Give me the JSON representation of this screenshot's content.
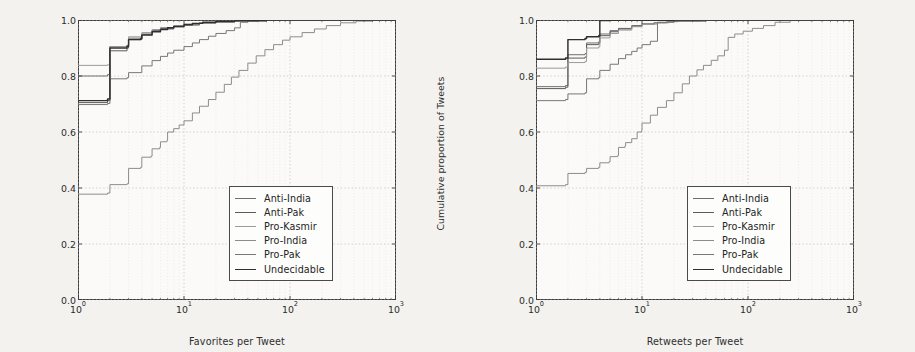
{
  "figure": {
    "background": "#f3f2ef",
    "panel_background": "#fbfaf8",
    "axis_color": "#3a3a3a",
    "grid_color": "#c9c9c9"
  },
  "ylabel": "Cumulative proportion of Tweets",
  "y_ticks": [
    "0.0",
    "0.2",
    "0.4",
    "0.6",
    "0.8",
    "1.0"
  ],
  "x_tick_bases": [
    "10",
    "10",
    "10",
    "10"
  ],
  "x_tick_exps": [
    "0",
    "1",
    "2",
    "3"
  ],
  "legend": {
    "entries": [
      {
        "label": "Anti-India",
        "color": "#6f6f6f"
      },
      {
        "label": "Anti-Pak",
        "color": "#5a5a5a"
      },
      {
        "label": "Pro-Kasmir",
        "color": "#9a9a9a"
      },
      {
        "label": "Pro-India",
        "color": "#8c8c8c"
      },
      {
        "label": "Pro-Pak",
        "color": "#777777"
      },
      {
        "label": "Undecidable",
        "color": "#2f2f2f"
      }
    ]
  },
  "chart_data": [
    {
      "type": "line",
      "panel": "left",
      "title": "",
      "xlabel": "Favorites per Tweet",
      "ylabel": "Cumulative proportion of Tweets",
      "xscale": "log",
      "xlim": [
        1,
        1000
      ],
      "ylim": [
        0.0,
        1.0
      ],
      "grid": true,
      "legend_position": "lower-right",
      "series": [
        {
          "name": "Anti-India",
          "color": "#6f6f6f",
          "points": [
            [
              1,
              0.8
            ],
            [
              1.9,
              0.805
            ],
            [
              2,
              0.905
            ],
            [
              2.9,
              0.908
            ],
            [
              3,
              0.935
            ],
            [
              4,
              0.95
            ],
            [
              5,
              0.962
            ],
            [
              6,
              0.97
            ],
            [
              8,
              0.978
            ],
            [
              10,
              0.984
            ],
            [
              14,
              0.99
            ],
            [
              20,
              0.994
            ],
            [
              30,
              0.997
            ],
            [
              50,
              0.999
            ],
            [
              100,
              1.0
            ],
            [
              1000,
              1.0
            ]
          ]
        },
        {
          "name": "Anti-Pak",
          "color": "#5a5a5a",
          "points": [
            [
              1,
              0.705
            ],
            [
              1.9,
              0.712
            ],
            [
              2,
              0.89
            ],
            [
              2.9,
              0.9
            ],
            [
              3,
              0.93
            ],
            [
              4,
              0.948
            ],
            [
              5,
              0.96
            ],
            [
              6,
              0.968
            ],
            [
              8,
              0.976
            ],
            [
              10,
              0.982
            ],
            [
              14,
              0.989
            ],
            [
              20,
              0.993
            ],
            [
              30,
              0.996
            ],
            [
              50,
              0.999
            ],
            [
              120,
              1.0
            ],
            [
              1000,
              1.0
            ]
          ]
        },
        {
          "name": "Pro-Kasmir",
          "color": "#9a9a9a",
          "points": [
            [
              1,
              0.838
            ],
            [
              1.9,
              0.84
            ],
            [
              2,
              0.905
            ],
            [
              2.9,
              0.91
            ],
            [
              3,
              0.94
            ],
            [
              4,
              0.955
            ],
            [
              5,
              0.966
            ],
            [
              6,
              0.973
            ],
            [
              8,
              0.98
            ],
            [
              10,
              0.986
            ],
            [
              14,
              0.991
            ],
            [
              20,
              0.995
            ],
            [
              30,
              0.998
            ],
            [
              60,
              1.0
            ],
            [
              1000,
              1.0
            ]
          ]
        },
        {
          "name": "Pro-India",
          "color": "#8c8c8c",
          "points": [
            [
              1,
              0.378
            ],
            [
              1.9,
              0.382
            ],
            [
              2,
              0.412
            ],
            [
              2.9,
              0.415
            ],
            [
              3,
              0.47
            ],
            [
              3.9,
              0.474
            ],
            [
              4,
              0.51
            ],
            [
              4.9,
              0.514
            ],
            [
              5,
              0.54
            ],
            [
              5.9,
              0.545
            ],
            [
              6,
              0.565
            ],
            [
              6.9,
              0.57
            ],
            [
              7,
              0.6
            ],
            [
              8,
              0.612
            ],
            [
              9,
              0.625
            ],
            [
              10,
              0.64
            ],
            [
              12,
              0.668
            ],
            [
              14,
              0.692
            ],
            [
              17,
              0.716
            ],
            [
              20,
              0.742
            ],
            [
              24,
              0.77
            ],
            [
              28,
              0.796
            ],
            [
              33,
              0.82
            ],
            [
              40,
              0.846
            ],
            [
              48,
              0.872
            ],
            [
              58,
              0.894
            ],
            [
              70,
              0.912
            ],
            [
              85,
              0.928
            ],
            [
              100,
              0.94
            ],
            [
              130,
              0.955
            ],
            [
              170,
              0.968
            ],
            [
              220,
              0.98
            ],
            [
              300,
              0.99
            ],
            [
              420,
              0.996
            ],
            [
              600,
              0.999
            ],
            [
              1000,
              1.0
            ]
          ]
        },
        {
          "name": "Pro-Pak",
          "color": "#777777",
          "points": [
            [
              1,
              0.698
            ],
            [
              1.9,
              0.702
            ],
            [
              2,
              0.79
            ],
            [
              2.9,
              0.794
            ],
            [
              3,
              0.812
            ],
            [
              4,
              0.836
            ],
            [
              5,
              0.855
            ],
            [
              6,
              0.87
            ],
            [
              7,
              0.882
            ],
            [
              8,
              0.892
            ],
            [
              10,
              0.905
            ],
            [
              12,
              0.918
            ],
            [
              14,
              0.93
            ],
            [
              17,
              0.942
            ],
            [
              20,
              0.952
            ],
            [
              25,
              0.962
            ],
            [
              30,
              0.972
            ],
            [
              34,
              0.992
            ],
            [
              40,
              0.996
            ],
            [
              60,
              0.999
            ],
            [
              120,
              1.0
            ],
            [
              1000,
              1.0
            ]
          ]
        },
        {
          "name": "Undecidable",
          "color": "#2f2f2f",
          "points": [
            [
              1,
              0.712
            ],
            [
              1.9,
              0.718
            ],
            [
              2,
              0.9
            ],
            [
              2.9,
              0.906
            ],
            [
              3,
              0.93
            ],
            [
              3.9,
              0.934
            ],
            [
              4,
              0.946
            ],
            [
              5,
              0.958
            ],
            [
              6,
              0.966
            ],
            [
              7,
              0.972
            ],
            [
              8,
              0.977
            ],
            [
              10,
              0.983
            ],
            [
              12,
              0.988
            ],
            [
              15,
              0.992
            ],
            [
              20,
              0.995
            ],
            [
              30,
              0.998
            ],
            [
              60,
              1.0
            ],
            [
              1000,
              1.0
            ]
          ]
        }
      ]
    },
    {
      "type": "line",
      "panel": "right",
      "title": "",
      "xlabel": "Retweets per Tweet",
      "ylabel": "Cumulative proportion of Tweets",
      "xscale": "log",
      "xlim": [
        1,
        1000
      ],
      "ylim": [
        0.0,
        1.0
      ],
      "grid": true,
      "legend_position": "lower-right",
      "series": [
        {
          "name": "Anti-India",
          "color": "#6f6f6f",
          "points": [
            [
              1,
              0.762
            ],
            [
              1.9,
              0.766
            ],
            [
              2,
              0.876
            ],
            [
              2.9,
              0.88
            ],
            [
              3,
              0.918
            ],
            [
              3.9,
              0.922
            ],
            [
              4,
              0.95
            ],
            [
              5,
              0.962
            ],
            [
              6,
              0.97
            ],
            [
              8,
              0.98
            ],
            [
              10,
              0.986
            ],
            [
              14,
              0.992
            ],
            [
              20,
              0.996
            ],
            [
              40,
              0.999
            ],
            [
              100,
              1.0
            ],
            [
              1000,
              1.0
            ]
          ]
        },
        {
          "name": "Anti-Pak",
          "color": "#5a5a5a",
          "points": [
            [
              1,
              0.755
            ],
            [
              1.9,
              0.76
            ],
            [
              2,
              0.864
            ],
            [
              2.9,
              0.868
            ],
            [
              3,
              0.912
            ],
            [
              3.9,
              0.916
            ],
            [
              4,
              0.944
            ],
            [
              5,
              0.958
            ],
            [
              6,
              0.968
            ],
            [
              8,
              0.978
            ],
            [
              10,
              0.985
            ],
            [
              13,
              0.991
            ],
            [
              18,
              0.995
            ],
            [
              35,
              0.999
            ],
            [
              90,
              1.0
            ],
            [
              1000,
              1.0
            ]
          ]
        },
        {
          "name": "Pro-Kasmir",
          "color": "#9a9a9a",
          "points": [
            [
              1,
              0.828
            ],
            [
              1.9,
              0.832
            ],
            [
              2,
              0.848
            ],
            [
              2.9,
              0.852
            ],
            [
              3,
              0.9
            ],
            [
              3.9,
              0.904
            ],
            [
              4,
              0.936
            ],
            [
              5,
              0.952
            ],
            [
              6,
              0.964
            ],
            [
              8,
              0.976
            ],
            [
              10,
              0.984
            ],
            [
              13,
              0.99
            ],
            [
              18,
              0.995
            ],
            [
              35,
              0.999
            ],
            [
              90,
              1.0
            ],
            [
              1000,
              1.0
            ]
          ]
        },
        {
          "name": "Pro-India",
          "color": "#8c8c8c",
          "points": [
            [
              1,
              0.408
            ],
            [
              1.9,
              0.412
            ],
            [
              2,
              0.452
            ],
            [
              2.9,
              0.456
            ],
            [
              3,
              0.47
            ],
            [
              3.9,
              0.474
            ],
            [
              4,
              0.49
            ],
            [
              4.9,
              0.494
            ],
            [
              5,
              0.512
            ],
            [
              5.9,
              0.516
            ],
            [
              6,
              0.545
            ],
            [
              6.9,
              0.55
            ],
            [
              7,
              0.562
            ],
            [
              8,
              0.576
            ],
            [
              9,
              0.6
            ],
            [
              9.9,
              0.604
            ],
            [
              10,
              0.632
            ],
            [
              12,
              0.66
            ],
            [
              14,
              0.688
            ],
            [
              17,
              0.712
            ],
            [
              20,
              0.74
            ],
            [
              24,
              0.772
            ],
            [
              28,
              0.8
            ],
            [
              33,
              0.822
            ],
            [
              38,
              0.838
            ],
            [
              45,
              0.856
            ],
            [
              52,
              0.872
            ],
            [
              60,
              0.892
            ],
            [
              65,
              0.938
            ],
            [
              75,
              0.95
            ],
            [
              90,
              0.96
            ],
            [
              110,
              0.97
            ],
            [
              140,
              0.98
            ],
            [
              180,
              0.992
            ],
            [
              250,
              0.998
            ],
            [
              400,
              1.0
            ],
            [
              1000,
              1.0
            ]
          ]
        },
        {
          "name": "Pro-Pak",
          "color": "#777777",
          "points": [
            [
              1,
              0.712
            ],
            [
              1.9,
              0.716
            ],
            [
              2,
              0.736
            ],
            [
              2.9,
              0.74
            ],
            [
              3,
              0.79
            ],
            [
              3.9,
              0.794
            ],
            [
              4,
              0.82
            ],
            [
              5,
              0.842
            ],
            [
              6,
              0.862
            ],
            [
              7,
              0.876
            ],
            [
              8,
              0.888
            ],
            [
              9,
              0.9
            ],
            [
              10,
              0.912
            ],
            [
              12,
              0.924
            ],
            [
              14,
              0.99
            ],
            [
              17,
              0.994
            ],
            [
              22,
              0.997
            ],
            [
              40,
              0.999
            ],
            [
              100,
              1.0
            ],
            [
              1000,
              1.0
            ]
          ]
        },
        {
          "name": "Undecidable",
          "color": "#2f2f2f",
          "points": [
            [
              1,
              0.86
            ],
            [
              1.9,
              0.864
            ],
            [
              2,
              0.93
            ],
            [
              2.9,
              0.934
            ],
            [
              3,
              0.94
            ],
            [
              3.9,
              0.944
            ],
            [
              4,
              0.998
            ],
            [
              5,
              0.999
            ],
            [
              8,
              0.999
            ],
            [
              20,
              1.0
            ],
            [
              1000,
              1.0
            ]
          ]
        }
      ]
    }
  ]
}
